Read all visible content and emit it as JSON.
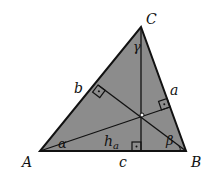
{
  "diagram": {
    "type": "triangle-with-altitudes",
    "fill_color": "#8c8c8c",
    "stroke_color": "#111111",
    "vertices": {
      "A": {
        "label": "A",
        "x": 40,
        "y": 151
      },
      "B": {
        "label": "B",
        "x": 186,
        "y": 151
      },
      "C": {
        "label": "C",
        "x": 141,
        "y": 27
      }
    },
    "sides": {
      "a": {
        "label": "a"
      },
      "b": {
        "label": "b"
      },
      "c": {
        "label": "c"
      }
    },
    "angles": {
      "alpha": {
        "label": "α"
      },
      "beta": {
        "label": "β"
      },
      "gamma": {
        "label": "γ"
      }
    },
    "altitude_label": {
      "main": "h",
      "sub": "a"
    },
    "orthocenter": {
      "x": 142,
      "y": 115
    },
    "right_angle_markers": 3
  }
}
